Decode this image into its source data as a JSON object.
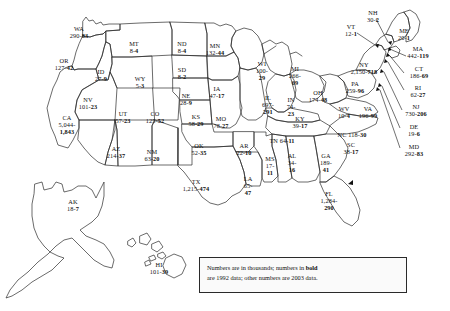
{
  "map": {
    "title": "United States map with state data labels",
    "legend": {
      "line1_a": "Numbers are in thousands; numbers in ",
      "line1_bold": "bold",
      "line2": "are 1992 data; other numbers are 2003 data."
    },
    "units": "thousands",
    "bold_year": "1992",
    "plain_year": "2003",
    "states": [
      {
        "code": "WA",
        "name": "Washington",
        "plain": "290",
        "bold": "83",
        "x": 79,
        "y": 25,
        "layout": "stack"
      },
      {
        "code": "OR",
        "name": "Oregon",
        "plain": "127",
        "bold": "42",
        "x": 64,
        "y": 57,
        "layout": "stack"
      },
      {
        "code": "ID",
        "name": "Idaho",
        "plain": "27",
        "bold": "9",
        "x": 101,
        "y": 68,
        "layout": "stack"
      },
      {
        "code": "MT",
        "name": "Montana",
        "plain": "8",
        "bold": "4",
        "x": 134,
        "y": 40,
        "layout": "stack"
      },
      {
        "code": "WY",
        "name": "Wyoming",
        "plain": "5",
        "bold": "3",
        "x": 140,
        "y": 75,
        "layout": "stack"
      },
      {
        "code": "NV",
        "name": "Nevada",
        "plain": "101",
        "bold": "23",
        "x": 88,
        "y": 96,
        "layout": "stack"
      },
      {
        "code": "UT",
        "name": "Utah",
        "plain": "57",
        "bold": "23",
        "x": 123,
        "y": 110,
        "layout": "stack"
      },
      {
        "code": "CA",
        "name": "California",
        "plain": "5,044",
        "bold": "1,843",
        "x": 67,
        "y": 114,
        "layout": "stack3"
      },
      {
        "code": "AZ",
        "name": "Arizona",
        "plain": "214",
        "bold": "37",
        "x": 116,
        "y": 145,
        "layout": "stack"
      },
      {
        "code": "NM",
        "name": "New Mexico",
        "plain": "63",
        "bold": "20",
        "x": 152,
        "y": 148,
        "layout": "stack"
      },
      {
        "code": "CO",
        "name": "Colorado",
        "plain": "125",
        "bold": "52",
        "x": 155,
        "y": 110,
        "layout": "stack"
      },
      {
        "code": "ND",
        "name": "North Dakota",
        "plain": "8",
        "bold": "4",
        "x": 182,
        "y": 40,
        "layout": "stack"
      },
      {
        "code": "SD",
        "name": "South Dakota",
        "plain": "8",
        "bold": "2",
        "x": 182,
        "y": 66,
        "layout": "stack"
      },
      {
        "code": "NE",
        "name": "Nebraska",
        "plain": "28",
        "bold": "9",
        "x": 186,
        "y": 92,
        "layout": "stack"
      },
      {
        "code": "KS",
        "name": "Kansas",
        "plain": "58",
        "bold": "29",
        "x": 196,
        "y": 113,
        "layout": "stack"
      },
      {
        "code": "OK",
        "name": "Oklahoma",
        "plain": "52",
        "bold": "35",
        "x": 199,
        "y": 142,
        "layout": "stack"
      },
      {
        "code": "TX",
        "name": "Texas",
        "plain": "1,215",
        "bold": "474",
        "x": 196,
        "y": 178,
        "layout": "stack-inline"
      },
      {
        "code": "MN",
        "name": "Minnesota",
        "plain": "132",
        "bold": "44",
        "x": 215,
        "y": 42,
        "layout": "stack-inline"
      },
      {
        "code": "IA",
        "name": "Iowa",
        "plain": "47",
        "bold": "17",
        "x": 217,
        "y": 85,
        "layout": "stack-inline"
      },
      {
        "code": "MO",
        "name": "Missouri",
        "plain": "78",
        "bold": "27",
        "x": 221,
        "y": 115,
        "layout": "stack-inline"
      },
      {
        "code": "AR",
        "name": "Arkansas",
        "plain": "22",
        "bold": "10",
        "x": 244,
        "y": 142,
        "layout": "stack-inline"
      },
      {
        "code": "LA",
        "name": "Louisiana",
        "plain": "65",
        "bold": "47",
        "x": 248,
        "y": 175,
        "layout": "stack3"
      },
      {
        "code": "WI",
        "name": "Wisconsin",
        "plain": "100",
        "bold": "29",
        "x": 262,
        "y": 60,
        "layout": "stack3"
      },
      {
        "code": "IL",
        "name": "Illinois",
        "plain": "697",
        "bold": "291",
        "x": 268,
        "y": 94,
        "layout": "stack3"
      },
      {
        "code": "MS",
        "name": "Mississippi",
        "plain": "17",
        "bold": "11",
        "x": 270,
        "y": 155,
        "layout": "stack3"
      },
      {
        "code": "MI",
        "name": "Michigan",
        "plain": "266",
        "bold": "69",
        "x": 295,
        "y": 65,
        "layout": "stack3"
      },
      {
        "code": "IN",
        "name": "Indiana",
        "plain": "74",
        "bold": "23",
        "x": 291,
        "y": 96,
        "layout": "stack3"
      },
      {
        "code": "AL",
        "name": "Alabama",
        "plain": "34",
        "bold": "16",
        "x": 292,
        "y": 152,
        "layout": "stack3"
      },
      {
        "code": "OH",
        "name": "Ohio",
        "plain": "174",
        "bold": "48",
        "x": 318,
        "y": 89,
        "layout": "stack-inline"
      },
      {
        "code": "KY",
        "name": "Kentucky",
        "plain": "39",
        "bold": "17",
        "x": 300,
        "y": 115,
        "layout": "stack-inline"
      },
      {
        "code": "TN",
        "name": "Tennessee",
        "plain": "64",
        "bold": "11",
        "x": 282,
        "y": 137,
        "layout": "oneline"
      },
      {
        "code": "GA",
        "name": "Georgia",
        "plain": "189",
        "bold": "41",
        "x": 326,
        "y": 152,
        "layout": "stack3"
      },
      {
        "code": "FL",
        "name": "Florida",
        "plain": "1,284",
        "bold": "290",
        "x": 329,
        "y": 190,
        "layout": "stack3"
      },
      {
        "code": "SC",
        "name": "South Carolina",
        "plain": "38",
        "bold": "17",
        "x": 351,
        "y": 141,
        "layout": "stack"
      },
      {
        "code": "NC",
        "name": "North Carolina",
        "plain": "118",
        "bold": "30",
        "x": 352,
        "y": 131,
        "layout": "oneline"
      },
      {
        "code": "WV",
        "name": "West Virginia",
        "plain": "10",
        "bold": "4",
        "x": 344,
        "y": 105,
        "layout": "stack"
      },
      {
        "code": "VA",
        "name": "Virginia",
        "plain": "196",
        "bold": "99",
        "x": 368,
        "y": 105,
        "layout": "stack"
      },
      {
        "code": "PA",
        "name": "Pennsylvania",
        "plain": "259",
        "bold": "96",
        "x": 355,
        "y": 80,
        "layout": "stack"
      },
      {
        "code": "NY",
        "name": "New York",
        "plain": "2,150",
        "bold": "718",
        "x": 364,
        "y": 61,
        "layout": "stack"
      },
      {
        "code": "VT",
        "name": "Vermont",
        "plain": "12",
        "bold": "1",
        "x": 351,
        "y": 23,
        "layout": "stack"
      },
      {
        "code": "NH",
        "name": "New Hampshire",
        "plain": "30",
        "bold": "2",
        "x": 373,
        "y": 9,
        "layout": "stack"
      },
      {
        "code": "ME",
        "name": "Maine",
        "plain": "20",
        "bold": "1",
        "x": 404,
        "y": 27,
        "layout": "stack"
      },
      {
        "code": "MA",
        "name": "Massachusetts",
        "plain": "442",
        "bold": "119",
        "x": 418,
        "y": 45,
        "layout": "stack"
      },
      {
        "code": "CT",
        "name": "Connecticut",
        "plain": "186",
        "bold": "69",
        "x": 419,
        "y": 65,
        "layout": "stack"
      },
      {
        "code": "RI",
        "name": "Rhode Island",
        "plain": "62",
        "bold": "27",
        "x": 418,
        "y": 84,
        "layout": "stack"
      },
      {
        "code": "NJ",
        "name": "New Jersey",
        "plain": "730",
        "bold": "206",
        "x": 416,
        "y": 103,
        "layout": "stack"
      },
      {
        "code": "DE",
        "name": "Delaware",
        "plain": "19",
        "bold": "6",
        "x": 414,
        "y": 123,
        "layout": "stack"
      },
      {
        "code": "MD",
        "name": "Maryland",
        "plain": "292",
        "bold": "83",
        "x": 414,
        "y": 143,
        "layout": "stack"
      },
      {
        "code": "AK",
        "name": "Alaska",
        "plain": "18",
        "bold": "7",
        "x": 73,
        "y": 198,
        "layout": "stack"
      },
      {
        "code": "HI",
        "name": "Hawaii",
        "plain": "101",
        "bold": "39",
        "x": 159,
        "y": 261,
        "layout": "stack"
      }
    ]
  }
}
